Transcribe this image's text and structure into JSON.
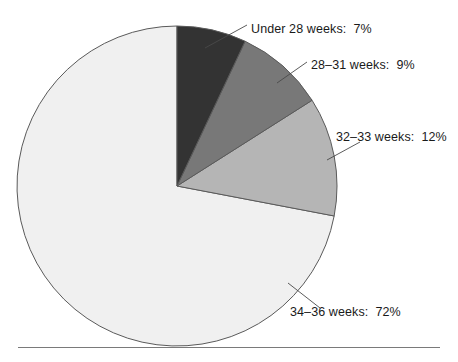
{
  "chart_data": {
    "type": "pie",
    "title": "",
    "subtitle": "",
    "xlabel": "",
    "ylabel": "",
    "legend_position": "none",
    "grid": false,
    "units": "percent",
    "total": 100,
    "categories": [
      "Under 28 weeks",
      "28–31 weeks",
      "32–33 weeks",
      "34–36 weeks"
    ],
    "values": [
      7,
      9,
      12,
      72
    ],
    "slice_colors": [
      "#333333",
      "#787878",
      "#b5b5b5",
      "#f0f0f0"
    ],
    "start_angle_deg": 0,
    "direction": "clockwise",
    "slices": [
      {
        "label": "Under 28 weeks",
        "value": 7,
        "value_text": "7%",
        "color": "#333333",
        "label_text": "Under 28 weeks:  7%"
      },
      {
        "label": "28–31 weeks",
        "value": 9,
        "value_text": "9%",
        "color": "#787878",
        "label_text": "28–31 weeks:  9%"
      },
      {
        "label": "32–33 weeks",
        "value": 12,
        "value_text": "12%",
        "color": "#b5b5b5",
        "label_text": "32–33 weeks:  12%"
      },
      {
        "label": "34–36 weeks",
        "value": 72,
        "value_text": "72%",
        "color": "#f0f0f0",
        "label_text": "34–36 weeks:  72%"
      }
    ]
  },
  "labels": {
    "under28": "Under 28 weeks:  7%",
    "w28_31": "28–31 weeks:  9%",
    "w32_33": "32–33 weeks:  12%",
    "w34_36": "34–36 weeks:  72%"
  },
  "colors": {
    "slice_under28": "#333333",
    "slice_28_31": "#787878",
    "slice_32_33": "#b5b5b5",
    "slice_34_36": "#f0f0f0",
    "outline": "#5a5a5a",
    "leader": "#4a4a4a",
    "text": "#1a1a1a",
    "rule": "#7a7a7a",
    "background": "#ffffff"
  }
}
